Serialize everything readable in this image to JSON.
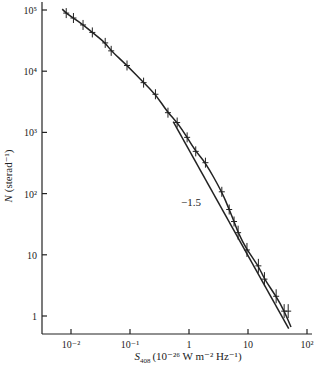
{
  "chart_data": {
    "type": "scatter",
    "title": "",
    "xlabel": "S408 (10^-26 W m^-2 Hz^-1)",
    "xlabel_parts": {
      "symbol": "S",
      "subscript": "408",
      "units": "(10⁻²⁶ W m⁻² Hz⁻¹)"
    },
    "ylabel": "N (sterad⁻¹)",
    "ylabel_parts": {
      "symbol": "N",
      "units": "(sterad⁻¹)"
    },
    "xscale": "log",
    "yscale": "log",
    "xlim": [
      0.004,
      120
    ],
    "ylim": [
      0.6,
      120000
    ],
    "grid": false,
    "legend": null,
    "x_ticks": [
      {
        "value": 0.01,
        "label": "10⁻²"
      },
      {
        "value": 0.1,
        "label": "10⁻¹"
      },
      {
        "value": 1,
        "label": "1"
      },
      {
        "value": 10,
        "label": "10"
      },
      {
        "value": 100,
        "label": "10²"
      }
    ],
    "y_ticks": [
      {
        "value": 1,
        "label": "1"
      },
      {
        "value": 10,
        "label": "10"
      },
      {
        "value": 100,
        "label": "10²"
      },
      {
        "value": 1000,
        "label": "10³"
      },
      {
        "value": 10000,
        "label": "10⁴"
      },
      {
        "value": 100000,
        "label": "10⁵"
      }
    ],
    "series": [
      {
        "name": "observed source counts",
        "style": "points with error bars + smooth fitted curve",
        "x": [
          0.0083,
          0.011,
          0.016,
          0.023,
          0.038,
          0.048,
          0.089,
          0.17,
          0.27,
          0.44,
          0.63,
          0.93,
          1.3,
          1.9,
          3.6,
          4.8,
          5.8,
          6.8,
          9.6,
          15,
          19,
          30,
          41,
          48
        ],
        "y": [
          89000,
          74000,
          57000,
          43000,
          29000,
          21500,
          12400,
          6500,
          4200,
          2100,
          1450,
          830,
          490,
          320,
          107,
          55,
          35,
          23,
          12,
          6.6,
          4.0,
          2.1,
          1.2,
          1.2
        ]
      },
      {
        "name": "slope -1.5 reference line",
        "style": "straight line",
        "x": [
          0.54,
          49
        ],
        "y": [
          1500,
          0.62
        ]
      }
    ],
    "annotations": [
      {
        "text": "−1.5",
        "x": 1.0,
        "y": 45,
        "refers_to": "slope -1.5 reference line"
      }
    ]
  }
}
